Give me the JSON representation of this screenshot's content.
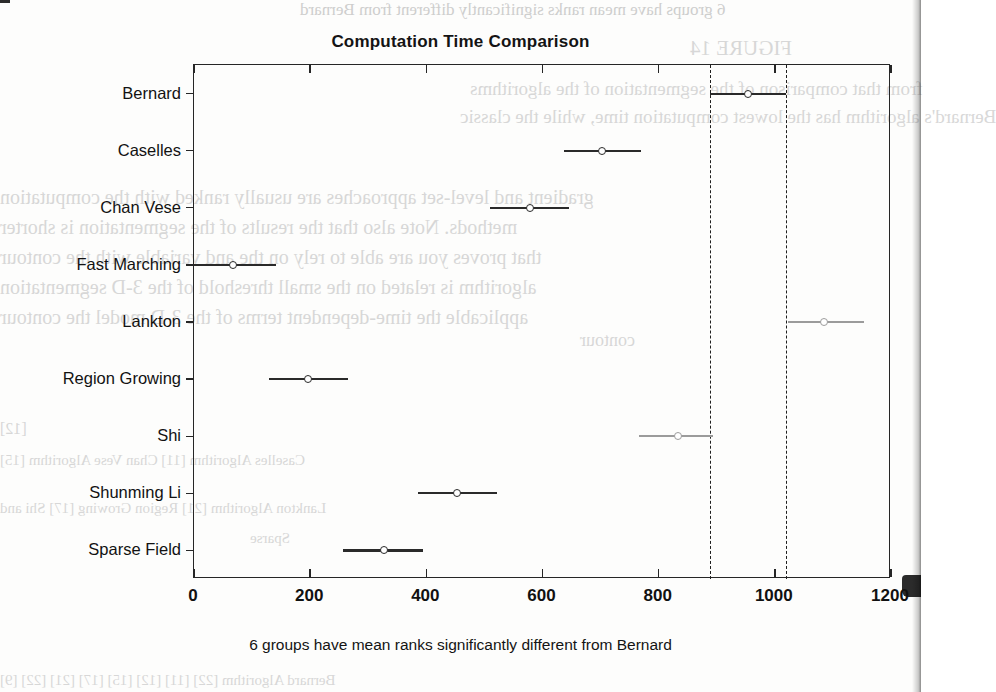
{
  "figure": {
    "title": "Computation Time Comparison",
    "caption": "6 groups have mean ranks significantly different from Bernard"
  },
  "axis": {
    "x_ticks": [
      "0",
      "200",
      "400",
      "600",
      "800",
      "1000",
      "1200"
    ],
    "y_labels": [
      "Bernard",
      "Caselles",
      "Chan Vese",
      "Fast Marching",
      "Lankton",
      "Region Growing",
      "Shi",
      "Shunming Li",
      "Sparse Field"
    ]
  },
  "colors": {
    "selected": "#2a2a2a",
    "significant": "#2a2a2a",
    "not_significant": "#9b9b9b",
    "reference": "#1e1e1e",
    "axis": "#262626"
  },
  "chart_data": {
    "type": "scatter",
    "title": "Computation Time Comparison",
    "xlabel": "",
    "ylabel": "",
    "xlim": [
      0,
      1200
    ],
    "xticks": [
      0,
      200,
      400,
      600,
      800,
      1000,
      1200
    ],
    "grid": false,
    "legend": "none",
    "annotations": [
      "6 groups have mean ranks significantly different from Bernard"
    ],
    "reference_lines": [
      888,
      1019
    ],
    "categories": [
      "Bernard",
      "Caselles",
      "Chan Vese",
      "Fast Marching",
      "Lankton",
      "Region Growing",
      "Shi",
      "Shunming Li",
      "Sparse Field"
    ],
    "series": [
      {
        "name": "mean rank",
        "values": [
          953,
          703,
          578,
          67,
          1084,
          196,
          833,
          453,
          327
        ]
      },
      {
        "name": "ci_lower",
        "values": [
          888,
          637,
          510,
          0,
          1022,
          129,
          766,
          385,
          256
        ]
      },
      {
        "name": "ci_upper",
        "values": [
          1019,
          769,
          646,
          141,
          1153,
          265,
          893,
          521,
          394
        ]
      }
    ],
    "points": [
      {
        "label": "Bernard",
        "mean": 953,
        "lower": 888,
        "upper": 1019,
        "highlight": "selected"
      },
      {
        "label": "Caselles",
        "mean": 703,
        "lower": 637,
        "upper": 769,
        "highlight": "significant"
      },
      {
        "label": "Chan Vese",
        "mean": 578,
        "lower": 510,
        "upper": 646,
        "highlight": "significant"
      },
      {
        "label": "Fast Marching",
        "mean": 67,
        "lower": 0,
        "upper": 141,
        "highlight": "significant"
      },
      {
        "label": "Lankton",
        "mean": 1084,
        "lower": 1022,
        "upper": 1153,
        "highlight": "not_significant"
      },
      {
        "label": "Region Growing",
        "mean": 196,
        "lower": 129,
        "upper": 265,
        "highlight": "significant"
      },
      {
        "label": "Shi",
        "mean": 833,
        "lower": 766,
        "upper": 893,
        "highlight": "not_significant"
      },
      {
        "label": "Shunming Li",
        "mean": 453,
        "lower": 385,
        "upper": 521,
        "highlight": "significant"
      },
      {
        "label": "Sparse Field",
        "mean": 327,
        "lower": 256,
        "upper": 394,
        "highlight": "significant"
      }
    ]
  },
  "scan_artifacts": {
    "top_line": "groups have mean ranks significantly different from Bernard",
    "lines": [
      "FIGURE 14",
      "from that comparison of the segmentation times of the algorithms",
      "Bernard's algorithm has the lowest computation time, while the classic",
      "gradient and level-set approaches are usually ranked with the computation",
      "methods. Note also that the results of the segmentation is shorter",
      "that proves you are able to rely on the and variable with the contour of",
      "algorithm is related on the small threshold of the 3-D segmentation",
      "applicable the time-dependent terms of the 3-D model the contour"
    ]
  }
}
